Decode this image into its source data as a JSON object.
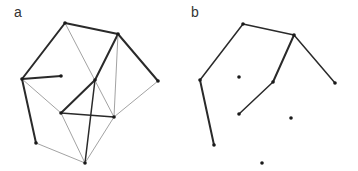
{
  "panels": [
    {
      "label": "a",
      "label_pos": [
        14,
        5
      ],
      "nodes": {
        "A": [
          65,
          23
        ],
        "B": [
          118,
          34
        ],
        "C": [
          158,
          81
        ],
        "D": [
          22,
          79
        ],
        "E": [
          61,
          76
        ],
        "F": [
          95,
          80
        ],
        "G": [
          61,
          113
        ],
        "H": [
          114,
          117
        ],
        "I": [
          36,
          143
        ],
        "J": [
          85,
          163
        ]
      },
      "edges": [
        {
          "from": "A",
          "to": "B",
          "weight": "thick"
        },
        {
          "from": "A",
          "to": "D",
          "weight": "thick"
        },
        {
          "from": "D",
          "to": "E",
          "weight": "thick"
        },
        {
          "from": "D",
          "to": "I",
          "weight": "thick"
        },
        {
          "from": "B",
          "to": "C",
          "weight": "thick"
        },
        {
          "from": "B",
          "to": "F",
          "weight": "thick"
        },
        {
          "from": "F",
          "to": "G",
          "weight": "thick"
        },
        {
          "from": "G",
          "to": "H",
          "weight": "medium"
        },
        {
          "from": "F",
          "to": "J",
          "weight": "medium"
        },
        {
          "from": "A",
          "to": "H",
          "weight": "thin"
        },
        {
          "from": "B",
          "to": "H",
          "weight": "thin"
        },
        {
          "from": "C",
          "to": "H",
          "weight": "thin"
        },
        {
          "from": "D",
          "to": "G",
          "weight": "thin"
        },
        {
          "from": "G",
          "to": "J",
          "weight": "thin"
        },
        {
          "from": "I",
          "to": "J",
          "weight": "thin"
        },
        {
          "from": "H",
          "to": "J",
          "weight": "thin"
        }
      ]
    },
    {
      "label": "b",
      "label_pos": [
        191,
        5
      ],
      "nodes": {
        "A": [
          243,
          24
        ],
        "B": [
          294,
          35
        ],
        "C": [
          335,
          83
        ],
        "D": [
          200,
          80
        ],
        "E": [
          239,
          77
        ],
        "F": [
          273,
          82
        ],
        "G": [
          239,
          114
        ],
        "H": [
          291,
          118
        ],
        "I": [
          214,
          145
        ],
        "J": [
          262,
          163
        ]
      },
      "edges": [
        {
          "from": "A",
          "to": "B",
          "weight": "medium"
        },
        {
          "from": "A",
          "to": "D",
          "weight": "medium"
        },
        {
          "from": "D",
          "to": "I",
          "weight": "thick"
        },
        {
          "from": "B",
          "to": "C",
          "weight": "medium"
        },
        {
          "from": "B",
          "to": "F",
          "weight": "thick"
        },
        {
          "from": "F",
          "to": "G",
          "weight": "medium"
        }
      ]
    }
  ],
  "style": {
    "edge_color": "#2a2a2a",
    "thin_color": "#8a8a8a",
    "node_color": "#1a1a1a",
    "label_color": "#333333"
  }
}
